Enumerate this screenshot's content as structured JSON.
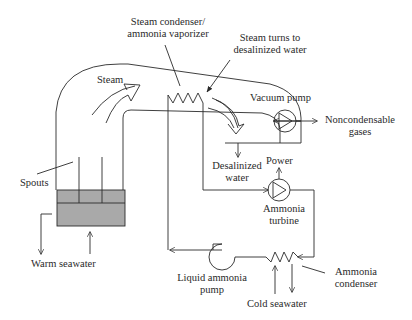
{
  "diagram": {
    "labels": {
      "condenser_line1": "Steam condenser/",
      "condenser_line2": "ammonia vaporizer",
      "steam_turns_line1": "Steam turns to",
      "steam_turns_line2": "desalinized water",
      "steam": "Steam",
      "vacuum_pump": "Vacuum pump",
      "noncond_line1": "Noncondensable",
      "noncond_line2": "gases",
      "spouts": "Spouts",
      "desal_line1": "Desalinized",
      "desal_line2": "water",
      "power": "Power",
      "turbine_line1": "Ammonia",
      "turbine_line2": "turbine",
      "warm_seawater": "Warm seawater",
      "liquid_pump_line1": "Liquid ammonia",
      "liquid_pump_line2": "pump",
      "amm_cond_line1": "Ammonia",
      "amm_cond_line2": "condenser",
      "cold_seawater": "Cold seawater"
    },
    "colors": {
      "line": "#2a2a2a",
      "water_fill": "#a9a9a9"
    }
  }
}
